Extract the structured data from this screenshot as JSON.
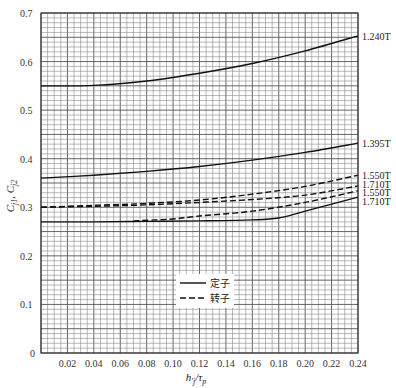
{
  "chart_data": {
    "type": "line",
    "title": "",
    "xlabel": "h'_j/τ_p",
    "ylabel": "C_j1, C_j2",
    "xlim": [
      0,
      0.24
    ],
    "ylim": [
      0,
      0.7
    ],
    "grid": true,
    "x_ticks": [
      "0.02",
      "0.04",
      "0.06",
      "0.08",
      "0.10",
      "0.12",
      "0.14",
      "0.16",
      "0.18",
      "0.20",
      "0.22",
      "0.24"
    ],
    "x_tick_values": [
      0.02,
      0.04,
      0.06,
      0.08,
      0.1,
      0.12,
      0.14,
      0.16,
      0.18,
      0.2,
      0.22,
      0.24
    ],
    "y_ticks": [
      "0",
      "0.1",
      "0.2",
      "0.3",
      "0.4",
      "0.5",
      "0.6",
      "0.7"
    ],
    "y_tick_values": [
      0,
      0.1,
      0.2,
      0.3,
      0.4,
      0.5,
      0.6,
      0.7
    ],
    "legend": {
      "position": "inside-lower-middle",
      "entries": [
        {
          "label": "定子",
          "style": "solid"
        },
        {
          "label": "转子",
          "style": "dashed"
        }
      ]
    },
    "series": [
      {
        "name": "1.240T",
        "group": "定子",
        "style": "solid",
        "x": [
          0,
          0.04,
          0.08,
          0.12,
          0.16,
          0.2,
          0.24
        ],
        "y": [
          0.55,
          0.551,
          0.56,
          0.576,
          0.596,
          0.622,
          0.653
        ]
      },
      {
        "name": "1.395T",
        "group": "定子",
        "style": "solid",
        "x": [
          0,
          0.04,
          0.08,
          0.12,
          0.16,
          0.2,
          0.24
        ],
        "y": [
          0.36,
          0.366,
          0.374,
          0.384,
          0.397,
          0.413,
          0.432
        ]
      },
      {
        "name": "1.550T",
        "group": "转子",
        "style": "dashed",
        "x": [
          0,
          0.04,
          0.08,
          0.12,
          0.16,
          0.2,
          0.24
        ],
        "y": [
          0.3,
          0.304,
          0.308,
          0.315,
          0.327,
          0.343,
          0.366
        ]
      },
      {
        "name": "1.710T",
        "group": "转子",
        "style": "dashed",
        "x": [
          0,
          0.04,
          0.08,
          0.12,
          0.16,
          0.2,
          0.24
        ],
        "y": [
          0.3,
          0.302,
          0.305,
          0.31,
          0.316,
          0.325,
          0.344
        ]
      },
      {
        "name": "1.550T",
        "group": "定子",
        "style": "solid",
        "x": [
          0.07,
          0.1,
          0.12,
          0.16,
          0.2,
          0.24
        ],
        "y": [
          0.272,
          0.276,
          0.282,
          0.292,
          0.31,
          0.334
        ],
        "dashed_segment_x": [
          0.07,
          0.18
        ]
      },
      {
        "name": "1.710T",
        "group": "定子",
        "style": "solid",
        "x": [
          0,
          0.04,
          0.08,
          0.12,
          0.16,
          0.18,
          0.2,
          0.24
        ],
        "y": [
          0.27,
          0.27,
          0.271,
          0.272,
          0.274,
          0.278,
          0.292,
          0.321
        ]
      }
    ],
    "curve_labels": [
      {
        "text": "1.240T",
        "y": 0.653
      },
      {
        "text": "1.395T",
        "y": 0.432
      },
      {
        "text": "1.550T",
        "y": 0.366
      },
      {
        "text": "1.710T",
        "y": 0.348
      },
      {
        "text": "1.550T",
        "y": 0.331
      },
      {
        "text": "1.710T",
        "y": 0.313
      }
    ]
  }
}
